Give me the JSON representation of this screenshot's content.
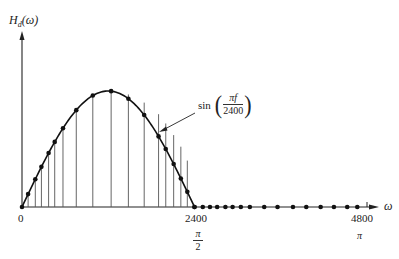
{
  "figure": {
    "y_axis_label": {
      "main": "H",
      "sub": "d",
      "arg": "(ω)"
    },
    "x_axis_label": "ω",
    "curve_annotation": {
      "func": "sin",
      "numerator": "πf",
      "denominator": "2400"
    },
    "x_ticks": [
      {
        "label": "0",
        "sub_label": ""
      },
      {
        "label": "2400",
        "sub_label_num": "π",
        "sub_label_den": "2"
      },
      {
        "label": "4800",
        "sub_label": "π"
      }
    ]
  },
  "chart_data": {
    "type": "line",
    "title": "",
    "xlabel": "ω",
    "ylabel": "H_d(ω)",
    "annotation": "sin(πf/2400)",
    "x_tick_labels": [
      "0",
      "2400",
      "4800"
    ],
    "x_tick_secondary_labels": [
      "",
      "π/2",
      "π"
    ],
    "xlim": [
      0,
      4800
    ],
    "ylim": [
      0,
      1
    ],
    "grid": false,
    "legend": "none",
    "series": [
      {
        "name": "sin(πf/2400) samples (passband)",
        "x": [
          0,
          85,
          185,
          270,
          370,
          455,
          570,
          755,
          985,
          1240,
          1480,
          1700,
          1900,
          2000,
          2110,
          2210,
          2300,
          2400
        ],
        "y": [
          0.0,
          0.11,
          0.24,
          0.35,
          0.46,
          0.56,
          0.67,
          0.84,
          0.96,
          1.0,
          0.97,
          0.9,
          0.8,
          0.72,
          0.62,
          0.52,
          0.4,
          0.0
        ]
      },
      {
        "name": "zero samples (stopband)",
        "x": [
          2400,
          2515,
          2615,
          2715,
          2830,
          2930,
          3045,
          3170,
          3370,
          3555,
          3770,
          3955,
          4155,
          4340,
          4525,
          4665
        ],
        "y": [
          0,
          0,
          0,
          0,
          0,
          0,
          0,
          0,
          0,
          0,
          0,
          0,
          0,
          0,
          0,
          0
        ]
      }
    ]
  }
}
